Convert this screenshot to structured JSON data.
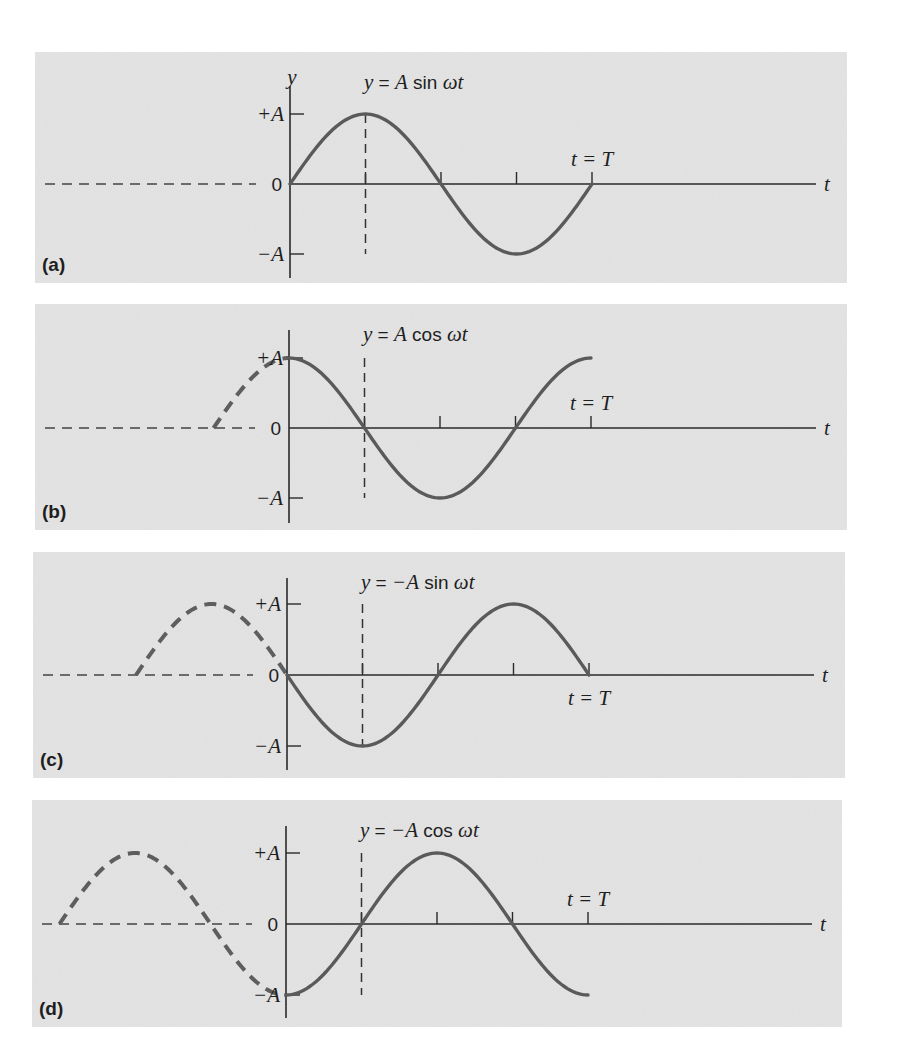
{
  "figure": {
    "colors": {
      "panel_background": "#e4e4e4",
      "curve": "#5a5a5a",
      "axis": "#2a2a2a"
    }
  },
  "chart_data": [
    {
      "type": "line",
      "panel_label": "(a)",
      "function": "sin",
      "sign": 1,
      "equation": {
        "lhs": "y",
        "eq": " = ",
        "amp": "A",
        "fn": " sin ",
        "arg": "ωt"
      },
      "y_axis_label": "y",
      "x_axis_label": "t",
      "y_ticks": [
        "+A",
        "0",
        "−A"
      ],
      "period_label": "t = T",
      "period_label_position": "above",
      "x_range_solid": [
        0,
        1
      ],
      "x_range_dashed_extension": null,
      "guide_line_at": 0.25,
      "tick_positions": [
        0.25,
        0.5,
        0.75,
        1.0
      ]
    },
    {
      "type": "line",
      "panel_label": "(b)",
      "function": "cos",
      "sign": 1,
      "equation": {
        "lhs": "y",
        "eq": " = ",
        "amp": "A",
        "fn": " cos ",
        "arg": "ωt"
      },
      "y_axis_label": "",
      "x_axis_label": "t",
      "y_ticks": [
        "+A",
        "0",
        "−A"
      ],
      "period_label": "t = T",
      "period_label_position": "above",
      "x_range_solid": [
        0,
        1
      ],
      "x_range_dashed_extension": [
        -0.25,
        0
      ],
      "guide_line_at": 0.25,
      "tick_positions": [
        0.25,
        0.5,
        0.75,
        1.0
      ]
    },
    {
      "type": "line",
      "panel_label": "(c)",
      "function": "sin",
      "sign": -1,
      "equation": {
        "lhs": "y",
        "eq": " = ",
        "amp": "−A",
        "fn": " sin ",
        "arg": "ωt"
      },
      "y_axis_label": "",
      "x_axis_label": "t",
      "y_ticks": [
        "+A",
        "0",
        "−A"
      ],
      "period_label": "t = T",
      "period_label_position": "below",
      "x_range_solid": [
        0,
        1
      ],
      "x_range_dashed_extension": [
        -0.5,
        0
      ],
      "guide_line_at": 0.25,
      "tick_positions": [
        0.25,
        0.5,
        0.75,
        1.0
      ]
    },
    {
      "type": "line",
      "panel_label": "(d)",
      "function": "cos",
      "sign": -1,
      "equation": {
        "lhs": "y",
        "eq": " = ",
        "amp": "−A",
        "fn": " cos ",
        "arg": "ωt"
      },
      "y_axis_label": "",
      "x_axis_label": "t",
      "y_ticks": [
        "+A",
        "0",
        "−A"
      ],
      "period_label": "t = T",
      "period_label_position": "above",
      "x_range_solid": [
        0,
        1
      ],
      "x_range_dashed_extension": [
        -0.75,
        0
      ],
      "guide_line_at": 0.25,
      "tick_positions": [
        0.25,
        0.5,
        0.75,
        1.0
      ]
    }
  ]
}
